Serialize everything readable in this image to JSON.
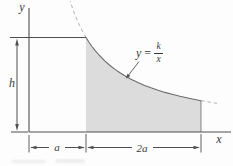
{
  "figure": {
    "axis": {
      "y_label": "y",
      "x_label": "x"
    },
    "dims": {
      "height_label": "h",
      "left_width_label": "a",
      "right_width_label": "2a"
    },
    "equation": {
      "lhs": "y",
      "equals": "=",
      "numerator": "k",
      "denominator": "x"
    },
    "colors": {
      "line": "#4f4f4f",
      "curve": "#6b6b6b",
      "shade": "#dcdcdc",
      "dash": "#b3b3b3",
      "text": "#3a3a3a",
      "bg": "#fdfdfd"
    }
  }
}
